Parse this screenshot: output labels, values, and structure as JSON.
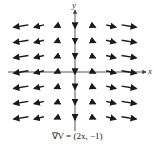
{
  "figure": {
    "caption": "∇V = (2x, −1)",
    "x_axis_label": "x",
    "y_axis_label": "y",
    "line_color": "#1a1a1a",
    "axis_color": "#444444"
  },
  "chart_data": {
    "type": "vector_field",
    "title": "∇V = (2x, −1)",
    "field": "(2x, -1)",
    "xlabel": "x",
    "ylabel": "y",
    "grid_x": [
      -3,
      -2,
      -1,
      0,
      1,
      2,
      3
    ],
    "grid_y": [
      3,
      2,
      1,
      0,
      -1,
      -2,
      -3
    ],
    "vectors_by_column": [
      {
        "x": -3,
        "vector": [
          -6,
          -1
        ]
      },
      {
        "x": -2,
        "vector": [
          -4,
          -1
        ]
      },
      {
        "x": -1,
        "vector": [
          -2,
          -1
        ]
      },
      {
        "x": 0,
        "vector": [
          0,
          -1
        ]
      },
      {
        "x": 1,
        "vector": [
          2,
          -1
        ]
      },
      {
        "x": 2,
        "vector": [
          4,
          -1
        ]
      },
      {
        "x": 3,
        "vector": [
          6,
          -1
        ]
      }
    ],
    "grid": false,
    "legend": "none"
  }
}
